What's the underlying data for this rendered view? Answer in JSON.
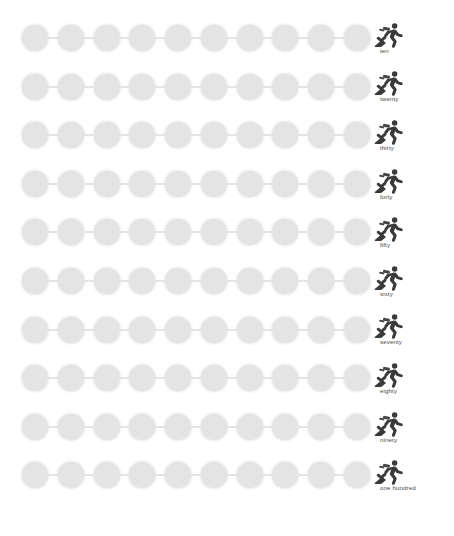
{
  "worksheet": {
    "title": "Skip counting by tens number lines",
    "dots_per_row": 10,
    "dot_color": "#e4e4e4",
    "line_color": "#c9c9c9",
    "icon_color": "#3a3a3a",
    "label_color": "#4a4a4a",
    "icon_name": "runner-icon",
    "watermark": "",
    "rows": [
      {
        "label": "ten",
        "value": 10
      },
      {
        "label": "twenty",
        "value": 20
      },
      {
        "label": "thirty",
        "value": 30
      },
      {
        "label": "forty",
        "value": 40
      },
      {
        "label": "fifty",
        "value": 50
      },
      {
        "label": "sixty",
        "value": 60
      },
      {
        "label": "seventy",
        "value": 70
      },
      {
        "label": "eighty",
        "value": 80
      },
      {
        "label": "ninety",
        "value": 90
      },
      {
        "label": "one hundred",
        "value": 100
      }
    ]
  }
}
